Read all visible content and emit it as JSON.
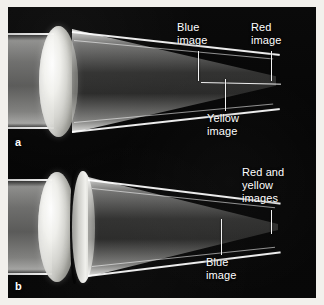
{
  "figure": {
    "background_color": "#f2f0ec",
    "plate_color": "#050505",
    "label_color": "#ffffff",
    "panels": [
      {
        "letter": "a",
        "name": "singlet-lens-chromatic-aberration",
        "lens_type": "simple biconvex lens",
        "callouts": [
          {
            "id": "blue-image-a",
            "text": "Blue\nimage"
          },
          {
            "id": "red-image-a",
            "text": "Red\nimage"
          },
          {
            "id": "yellow-image-a",
            "text": "Yellow\nimage"
          }
        ]
      },
      {
        "letter": "b",
        "name": "achromatic-doublet-corrected",
        "lens_type": "achromatic doublet",
        "callouts": [
          {
            "id": "red-yellow-images-b",
            "text": "Red and\nyellow\nimages"
          },
          {
            "id": "blue-image-b",
            "text": "Blue\nimage"
          }
        ]
      }
    ]
  }
}
